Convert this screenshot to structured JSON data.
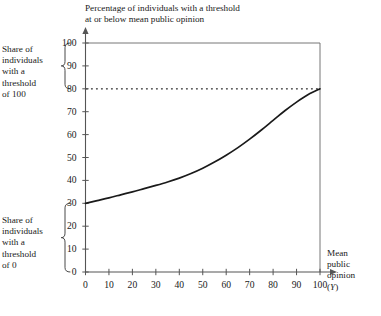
{
  "chart_data": {
    "type": "line",
    "title": "Percentage of individuals with a threshold at or below mean public opinion",
    "title_line1": "Percentage of individuals with a threshold",
    "title_line2": "at or below mean public opinion",
    "xlabel": "Mean public opinion (Y)",
    "xlabel_line1": "Mean",
    "xlabel_line2": "public",
    "xlabel_line3": "opinion",
    "xlabel_line4": "(Y)",
    "xlabel_variable": "Y",
    "ylabel": "Percentage of individuals with a threshold at or below mean public opinion",
    "xlim": [
      0,
      100
    ],
    "ylim": [
      0,
      100
    ],
    "xticks": [
      0,
      10,
      20,
      30,
      40,
      50,
      60,
      70,
      80,
      90,
      100
    ],
    "yticks": [
      0,
      10,
      20,
      30,
      40,
      50,
      60,
      70,
      80,
      90,
      100
    ],
    "grid": false,
    "legend": "none",
    "series": [
      {
        "name": "Percentage at or below mean public opinion",
        "style": "solid",
        "color": "#1a1a1a",
        "x": [
          0,
          5,
          10,
          15,
          20,
          25,
          30,
          35,
          40,
          45,
          50,
          55,
          60,
          65,
          70,
          75,
          80,
          85,
          90,
          95,
          100
        ],
        "values": [
          30.0,
          31.2,
          32.4,
          33.7,
          35.0,
          36.4,
          37.8,
          39.3,
          41.0,
          43.0,
          45.3,
          48.0,
          51.0,
          54.3,
          58.0,
          62.0,
          66.2,
          70.4,
          74.2,
          77.5,
          80.0
        ]
      }
    ],
    "annotations": [
      {
        "name": "reference-line-80",
        "type": "horizontal-dotted-line",
        "y": 80,
        "x_from": 0,
        "x_to": 100,
        "color": "#1a1a1a"
      },
      {
        "name": "plot-border-top",
        "type": "horizontal-line",
        "y": 100,
        "x_from": 0,
        "x_to": 100,
        "color": "#555555"
      },
      {
        "name": "plot-border-right",
        "type": "vertical-line",
        "x": 100,
        "y_from": 0,
        "y_to": 100,
        "color": "#555555"
      },
      {
        "name": "brace-threshold-100",
        "type": "curly-brace",
        "y_from": 80,
        "y_to": 100,
        "label": "Share of individuals with a threshold of 100"
      },
      {
        "name": "brace-threshold-0",
        "type": "curly-brace",
        "y_from": 0,
        "y_to": 30,
        "label": "Share of individuals with a threshold of 0"
      }
    ]
  },
  "notes": {
    "top": {
      "line1": "Share of",
      "line2": "individuals",
      "line3": "with a",
      "line4": "threshold",
      "line5": "of 100"
    },
    "bottom": {
      "line1": "Share of",
      "line2": "individuals",
      "line3": "with a",
      "line4": "threshold",
      "line5": "of 0"
    }
  },
  "axes": {
    "y_tick_labels": [
      "100",
      "90",
      "80",
      "70",
      "60",
      "50",
      "40",
      "30",
      "20",
      "10",
      "0"
    ],
    "x_tick_labels": [
      "0",
      "10",
      "20",
      "30",
      "40",
      "50",
      "60",
      "70",
      "80",
      "90",
      "100"
    ]
  },
  "colors": {
    "curve": "#1a1a1a",
    "axis": "#555555",
    "text": "#1a1a1a",
    "background": "#ffffff"
  }
}
